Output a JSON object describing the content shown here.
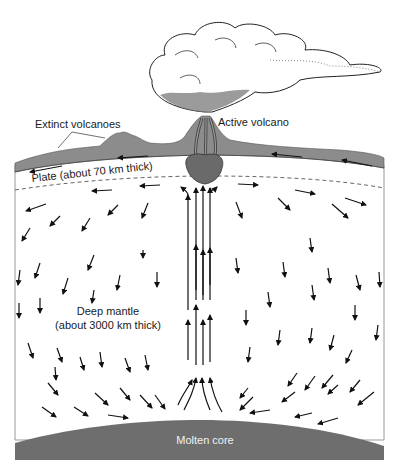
{
  "diagram": {
    "labels": {
      "extinct_volcanoes": "Extinct volcanoes",
      "active_volcano": "Active volcano",
      "plate": "Plate (about 70 km thick)",
      "deep_mantle_line1": "Deep mantle",
      "deep_mantle_line2": "(about 3000 km thick)",
      "molten_core": "Molten core"
    },
    "colors": {
      "crust": "#8c8c8c",
      "core": "#6e6e6e",
      "plume_head": "#6a6a6a",
      "arrow": "#111111",
      "background": "#ffffff"
    }
  }
}
